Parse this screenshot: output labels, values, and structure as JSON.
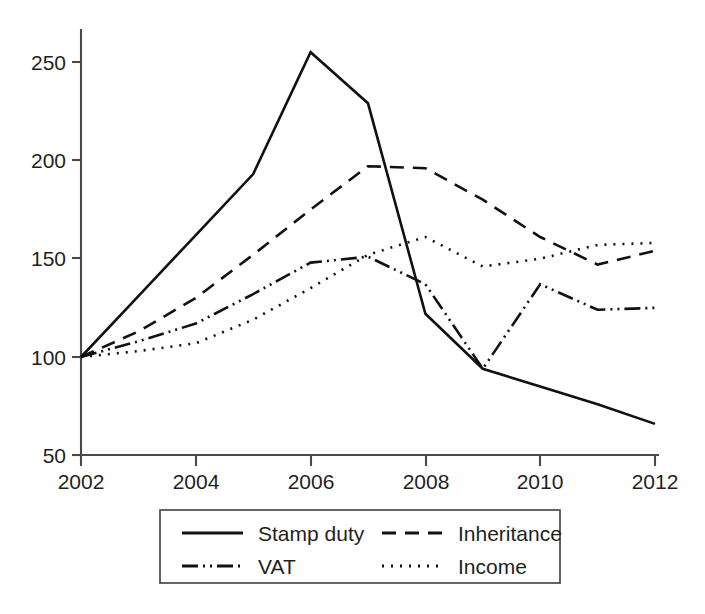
{
  "chart_data": {
    "type": "line",
    "title": "",
    "subtitle": "",
    "xlabel": "",
    "ylabel": "",
    "x": [
      2002,
      2003,
      2004,
      2005,
      2006,
      2007,
      2008,
      2009,
      2010,
      2011,
      2012
    ],
    "xtick_labels": [
      "2002",
      "2004",
      "2006",
      "2008",
      "2010",
      "2012"
    ],
    "xticks": [
      2002,
      2004,
      2006,
      2008,
      2010,
      2012
    ],
    "ytick_labels": [
      "50",
      "100",
      "150",
      "200",
      "250"
    ],
    "yticks": [
      50,
      100,
      150,
      200,
      250
    ],
    "xlim": [
      2002,
      2012
    ],
    "ylim": [
      50,
      265
    ],
    "grid": false,
    "legend_position": "bottom-center",
    "series": [
      {
        "name": "Stamp duty",
        "style": "solid",
        "dash": "none",
        "color": "#111111",
        "values": [
          100,
          131,
          162,
          193,
          255,
          229,
          122,
          94,
          85,
          76,
          66
        ]
      },
      {
        "name": "Inheritance",
        "style": "dashed",
        "dash": "14,9",
        "color": "#111111",
        "values": [
          100,
          113,
          130,
          152,
          175,
          197,
          196,
          180,
          161,
          147,
          154
        ]
      },
      {
        "name": "VAT",
        "style": "dash-dot-dot",
        "dash": "16,5,2,5,2,5",
        "color": "#111111",
        "values": [
          100,
          108,
          117,
          132,
          148,
          151,
          137,
          94,
          137,
          124,
          125
        ]
      },
      {
        "name": "Income",
        "style": "dotted",
        "dash": "2,7",
        "color": "#111111",
        "values": [
          100,
          103,
          107,
          119,
          135,
          152,
          161,
          146,
          150,
          157,
          158
        ]
      }
    ]
  },
  "legend": {
    "entries": [
      {
        "label": "Stamp duty",
        "dash": "none"
      },
      {
        "label": "Inheritance",
        "dash": "14,9"
      },
      {
        "label": "VAT",
        "dash": "16,5,2,5,2,5"
      },
      {
        "label": "Income",
        "dash": "2,7"
      }
    ]
  },
  "axes": {
    "y_tick_0": "50",
    "y_tick_1": "100",
    "y_tick_2": "150",
    "y_tick_3": "200",
    "y_tick_4": "250",
    "x_tick_0": "2002",
    "x_tick_1": "2004",
    "x_tick_2": "2006",
    "x_tick_3": "2008",
    "x_tick_4": "2010",
    "x_tick_5": "2012"
  }
}
